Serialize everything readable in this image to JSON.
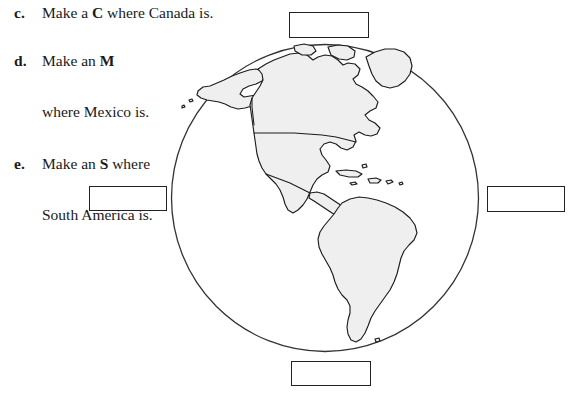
{
  "worksheet": {
    "background_color": "#ffffff",
    "ink_color": "#1a1a1a",
    "land_fill_color": "#efefef",
    "outline_color": "#222222",
    "instructions": [
      {
        "marker": "c.",
        "lines": [
          {
            "before": "Make a ",
            "emphasis": "C",
            "after": " where Canada is."
          }
        ]
      },
      {
        "marker": "d.",
        "lines": [
          {
            "before": "Make an ",
            "emphasis": "M",
            "after": ""
          },
          {
            "before": "where Mexico is.",
            "emphasis": "",
            "after": ""
          }
        ]
      },
      {
        "marker": "e.",
        "lines": [
          {
            "before": "Make an ",
            "emphasis": "S",
            "after": " where"
          },
          {
            "before": "South America is.",
            "emphasis": "",
            "after": ""
          }
        ]
      }
    ],
    "answer_boxes": [
      {
        "position": "top",
        "value": ""
      },
      {
        "position": "left",
        "value": ""
      },
      {
        "position": "right",
        "value": ""
      },
      {
        "position": "bottom",
        "value": ""
      }
    ],
    "globe": {
      "label": "globe-western-hemisphere",
      "center_x": 325,
      "center_y": 198,
      "radius": 155,
      "regions": [
        "Alaska",
        "Canada",
        "Greenland",
        "United States",
        "Mexico",
        "Central America",
        "Caribbean islands",
        "South America"
      ]
    }
  }
}
